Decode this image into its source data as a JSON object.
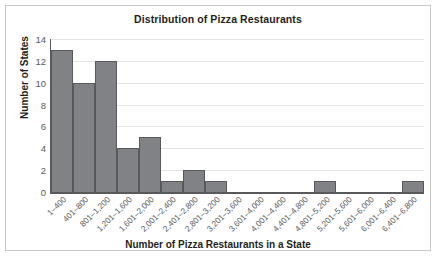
{
  "chart_data": {
    "type": "bar",
    "title": "Distribution of Pizza Restaurants",
    "xlabel": "Number of Pizza Restaurants in a State",
    "ylabel": "Number of States",
    "categories": [
      "1–400",
      "401–800",
      "801–1,200",
      "1,201–1,600",
      "1,601–2,000",
      "2,001–2,400",
      "2,401–2,800",
      "2,801–3,200",
      "3,201–3,600",
      "3,601–4,000",
      "4,001–4,400",
      "4,401–4,800",
      "4,801–5,200",
      "5,201–5,600",
      "5,601–6,000",
      "6,001–6,400",
      "6,401–6,800"
    ],
    "values": [
      13,
      10,
      12,
      4,
      5,
      1,
      2,
      1,
      0,
      0,
      0,
      0,
      1,
      0,
      0,
      0,
      1
    ],
    "ylim": [
      0,
      14
    ],
    "yticks": [
      0,
      2,
      4,
      6,
      8,
      10,
      12,
      14
    ],
    "ytick_labels": [
      "0",
      "2",
      "4",
      "6",
      "8",
      "10",
      "12",
      "14"
    ],
    "grid": "horizontal",
    "legend": "none",
    "bar_color": "#808285",
    "bar_edge_color": "#58595b",
    "axis_color": "#58595b",
    "grid_color": "#e4e4e4",
    "text_color": "#231f20"
  }
}
